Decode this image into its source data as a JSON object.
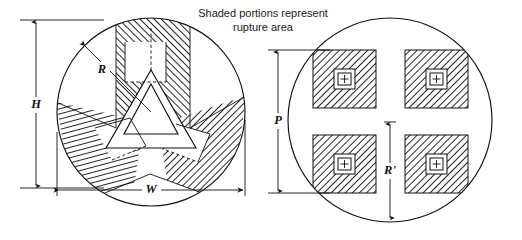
{
  "figure": {
    "caption_line1": "Shaded portions represent",
    "caption_line2": "rupture area",
    "background_color": "#ffffff",
    "line_color": "#111111",
    "hatch_color": "#1a1a1a"
  },
  "left_view": {
    "name": "three-lobe-rupture-pattern",
    "description": "Circular disc with three-armed shaded rupture area and central triangular opening",
    "dimensions": [
      {
        "id": "H",
        "label": "H",
        "orientation": "vertical",
        "side": "left"
      },
      {
        "id": "W",
        "label": "W",
        "orientation": "horizontal",
        "side": "bottom"
      },
      {
        "id": "R",
        "label": "R",
        "orientation": "radial",
        "side": "upper-left"
      }
    ],
    "circle": {
      "cx": 151,
      "cy": 112,
      "r": 94
    },
    "lobe_count": 3
  },
  "right_view": {
    "name": "four-square-rupture-pattern",
    "description": "Circular disc with four square shaded rupture areas each containing a crosshair target",
    "dimensions": [
      {
        "id": "P",
        "label": "P",
        "orientation": "vertical",
        "side": "left"
      },
      {
        "id": "Rprime",
        "label": "R'",
        "orientation": "vertical",
        "side": "center"
      }
    ],
    "circle": {
      "cx": 390,
      "cy": 120,
      "r": 102
    },
    "square_count": 4,
    "target_glyph": "plus-crosshair"
  }
}
